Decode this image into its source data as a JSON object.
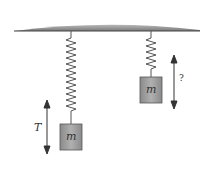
{
  "figure": {
    "left_system": {
      "mass_label": "m",
      "period_label": "T"
    },
    "right_system": {
      "mass_label": "m",
      "period_label": "?"
    },
    "colors": {
      "ceiling": "#8a8a8a",
      "block": "#9a9a9a",
      "spring": "#555555"
    }
  }
}
